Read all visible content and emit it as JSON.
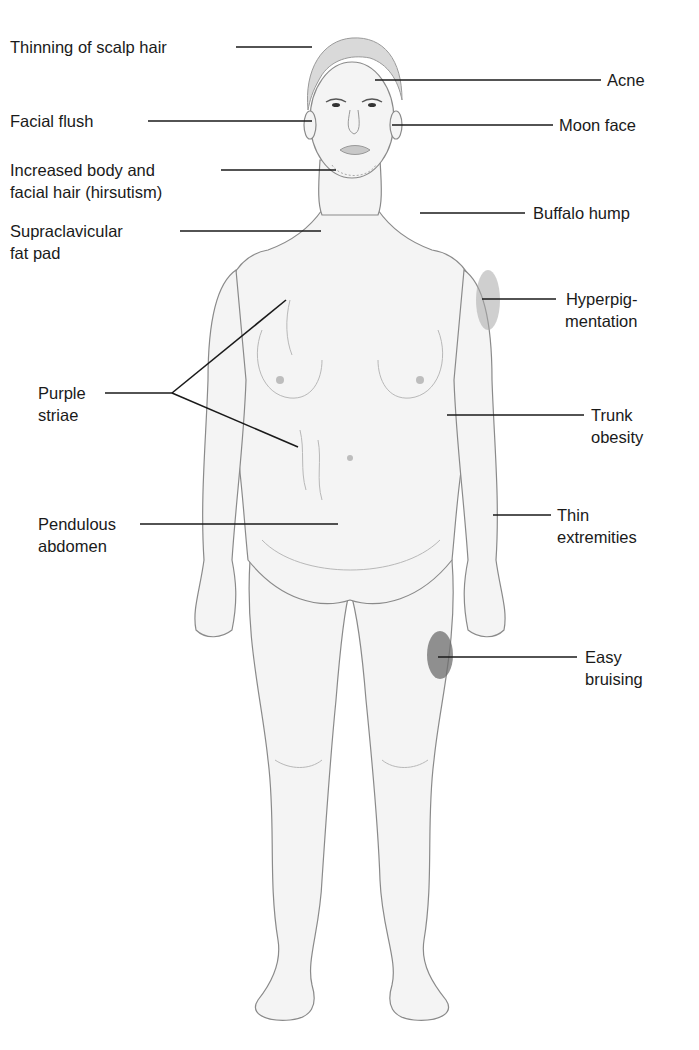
{
  "figure": {
    "colors": {
      "leader_line": "#1a1a1a",
      "label_text": "#1a1a1a",
      "skin": "#f4f4f4",
      "outline": "#8a8a8a",
      "bruise": "#6e6e6e",
      "hyperpigmentation": "#a8a8a8",
      "background": "#ffffff"
    }
  },
  "labels_left": [
    {
      "id": "thinning-scalp-hair",
      "lines": [
        "Thinning of scalp hair"
      ]
    },
    {
      "id": "facial-flush",
      "lines": [
        "Facial flush"
      ]
    },
    {
      "id": "hirsutism",
      "lines": [
        "Increased body and",
        "facial hair (hirsutism)"
      ]
    },
    {
      "id": "supraclavicular-fat-pad",
      "lines": [
        "Supraclavicular",
        "fat pad"
      ]
    },
    {
      "id": "purple-striae",
      "lines": [
        "Purple",
        "striae"
      ]
    },
    {
      "id": "pendulous-abdomen",
      "lines": [
        "Pendulous",
        "abdomen"
      ]
    }
  ],
  "labels_right": [
    {
      "id": "acne",
      "lines": [
        "Acne"
      ]
    },
    {
      "id": "moon-face",
      "lines": [
        "Moon face"
      ]
    },
    {
      "id": "buffalo-hump",
      "lines": [
        "Buffalo hump"
      ]
    },
    {
      "id": "hyperpigmentation",
      "lines": [
        "Hyperpig-",
        "mentation"
      ]
    },
    {
      "id": "trunk-obesity",
      "lines": [
        "Trunk",
        "obesity"
      ]
    },
    {
      "id": "thin-extremities",
      "lines": [
        "Thin",
        "extremities"
      ]
    },
    {
      "id": "easy-bruising",
      "lines": [
        "Easy",
        "bruising"
      ]
    }
  ]
}
